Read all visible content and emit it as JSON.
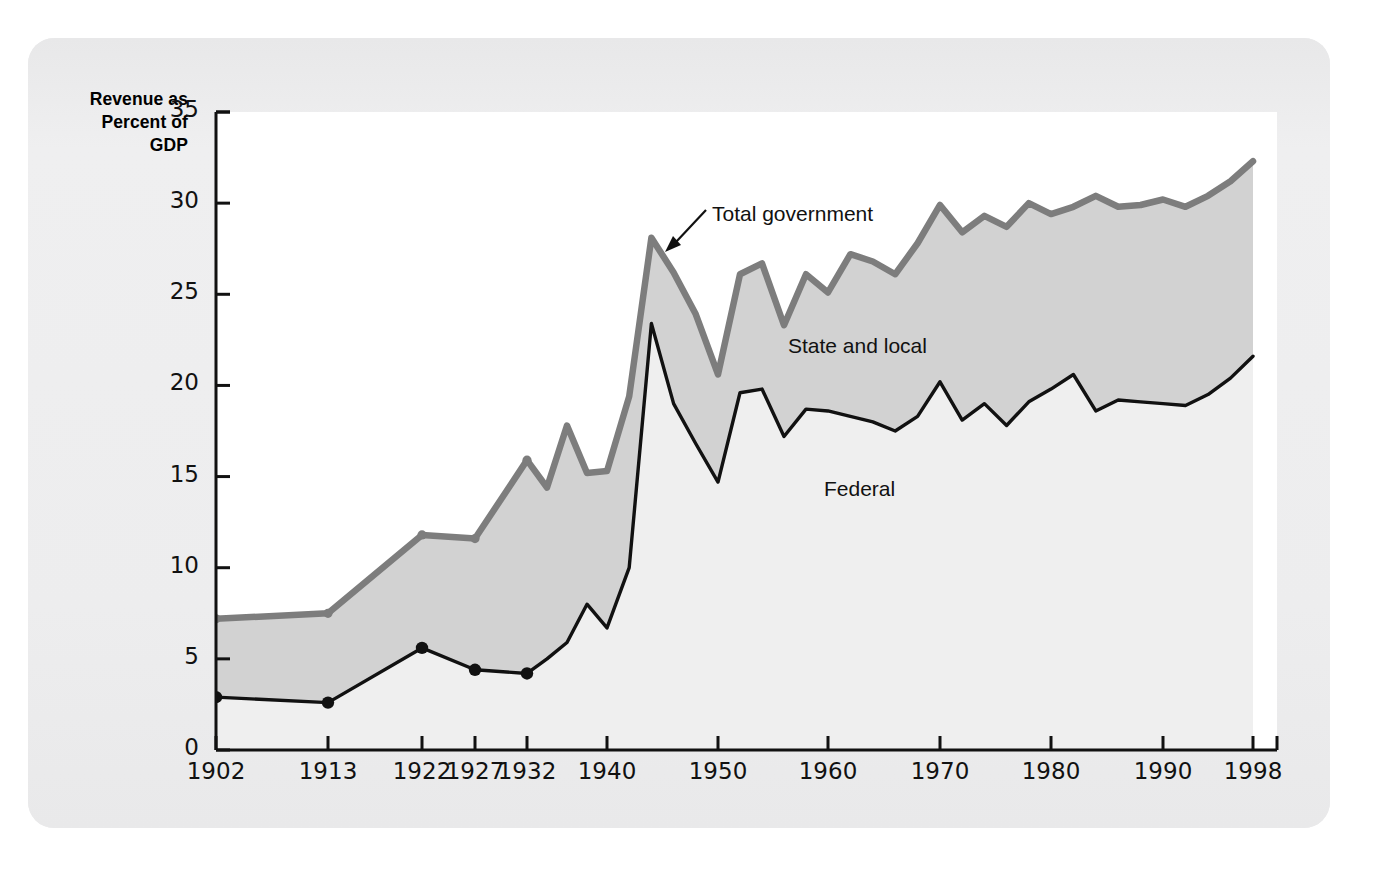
{
  "figure": {
    "axis_title": "Revenue as\nPercent of\nGDP",
    "axis_title_lines": [
      "Revenue as",
      "Percent of",
      "GDP"
    ],
    "background_color": "#ececed",
    "plot_background_color": "#ffffff"
  },
  "annotations": [
    {
      "name": "total-government",
      "label": "Total government",
      "x": 712,
      "y": 202,
      "leader": true
    },
    {
      "name": "state-and-local",
      "label": "State and local",
      "x": 788,
      "y": 334,
      "leader": false
    },
    {
      "name": "federal",
      "label": "Federal",
      "x": 824,
      "y": 477,
      "leader": false
    }
  ],
  "chart_data": {
    "type": "area",
    "title": "",
    "subtitle": "",
    "xlabel": "",
    "ylabel": "Revenue as Percent of GDP",
    "ylim": [
      0,
      35
    ],
    "yticks": [
      0,
      5,
      10,
      15,
      20,
      25,
      30,
      35
    ],
    "xtick_labels": [
      "1902",
      "1913",
      "1922",
      "1927",
      "1932",
      "1940",
      "1950",
      "1960",
      "1970",
      "1980",
      "1990",
      "1998"
    ],
    "xtick_positions": [
      1902,
      1913,
      1922,
      1927,
      1932,
      1940,
      1950,
      1960,
      1970,
      1980,
      1990,
      1998
    ],
    "grid": false,
    "legend_position": "inline-annotations",
    "colors": {
      "total_government_line": "#7d7d7d",
      "federal_line": "#111111",
      "state_and_local_band": "#d2d2d2",
      "federal_band": "#efefef",
      "marker": "#111111"
    },
    "marker_years": [
      1902,
      1913,
      1922,
      1927,
      1932
    ],
    "x": [
      1902,
      1913,
      1922,
      1927,
      1932,
      1934,
      1936,
      1938,
      1940,
      1942,
      1944,
      1946,
      1948,
      1950,
      1952,
      1954,
      1956,
      1958,
      1960,
      1962,
      1964,
      1966,
      1968,
      1970,
      1972,
      1974,
      1976,
      1978,
      1980,
      1982,
      1984,
      1986,
      1988,
      1990,
      1992,
      1994,
      1996,
      1998
    ],
    "series": [
      {
        "name": "Total government",
        "values": [
          7.2,
          7.5,
          11.8,
          11.6,
          15.9,
          14.4,
          17.8,
          15.2,
          15.3,
          19.4,
          28.1,
          26.2,
          23.9,
          20.6,
          26.1,
          26.7,
          23.3,
          26.1,
          25.1,
          27.2,
          26.8,
          26.1,
          27.8,
          29.9,
          28.4,
          29.3,
          28.7,
          30.0,
          29.4,
          29.8,
          30.4,
          29.8,
          29.9,
          30.2,
          29.8,
          30.4,
          31.2,
          32.3
        ]
      },
      {
        "name": "Federal",
        "values": [
          2.9,
          2.6,
          5.6,
          4.4,
          4.2,
          5.0,
          5.9,
          8.0,
          6.7,
          10.0,
          23.4,
          19.0,
          16.8,
          14.7,
          19.6,
          19.8,
          17.2,
          18.7,
          18.6,
          18.3,
          18.0,
          17.5,
          18.3,
          20.2,
          18.1,
          19.0,
          17.8,
          19.1,
          19.8,
          20.6,
          18.6,
          19.2,
          19.1,
          19.0,
          18.9,
          19.5,
          20.4,
          21.6
        ]
      }
    ],
    "derived_series": [
      {
        "name": "State and local",
        "description": "Shaded band between Total government and Federal lines"
      }
    ]
  }
}
